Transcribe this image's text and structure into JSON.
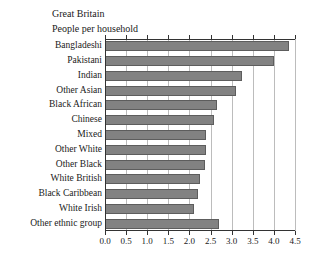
{
  "titles": {
    "line1": "Great Britain",
    "line2": "People per household"
  },
  "axis": {
    "tick_labels": [
      "0.0",
      "0.5",
      "1.0",
      "1.5",
      "2.0",
      "2.5",
      "3.0",
      "3.5",
      "4.0",
      "4.5"
    ]
  },
  "colors": {
    "bar_fill": "#828282",
    "bar_edge": "#5d5d5d",
    "gridline": "#bcbcbc",
    "axis": "#333333",
    "text": "#1a1a1a",
    "background": "#ffffff"
  },
  "chart_data": {
    "type": "bar",
    "orientation": "horizontal",
    "title": "Great Britain",
    "subtitle": "People per household",
    "xlabel": "",
    "ylabel": "",
    "xlim": [
      0.0,
      4.5
    ],
    "xticks": [
      0.0,
      0.5,
      1.0,
      1.5,
      2.0,
      2.5,
      3.0,
      3.5,
      4.0,
      4.5
    ],
    "grid": true,
    "legend": false,
    "categories": [
      "Bangladeshi",
      "Pakistani",
      "Indian",
      "Other Asian",
      "Black African",
      "Chinese",
      "Mixed",
      "Other White",
      "Other Black",
      "White British",
      "Black Caribbean",
      "White Irish",
      "Other ethnic group"
    ],
    "values": [
      4.35,
      4.0,
      3.25,
      3.1,
      2.65,
      2.57,
      2.4,
      2.4,
      2.37,
      2.25,
      2.2,
      2.1,
      2.7
    ]
  }
}
